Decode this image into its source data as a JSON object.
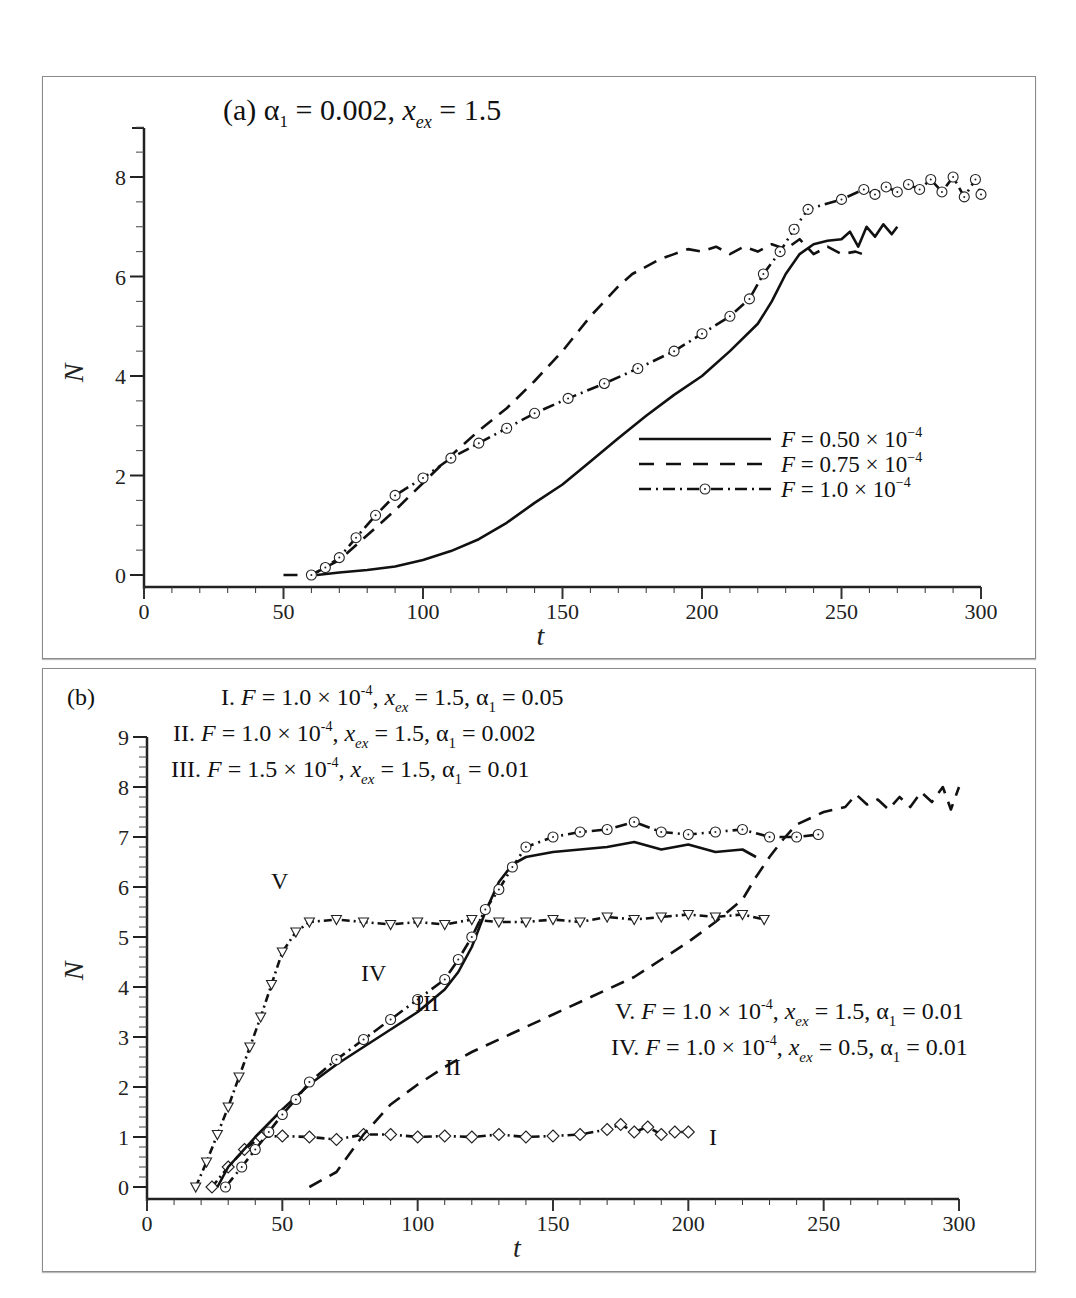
{
  "chart_data": [
    {
      "panel": "a",
      "type": "line",
      "title": "(a) α₁ = 0.002, x_ex = 1.5",
      "title_parts": {
        "label": "(a) ",
        "alpha": "α",
        "alpha_sub": "1",
        "eq1": " = 0.002, ",
        "x": "x",
        "x_sub": "ex",
        "eq2": " = 1.5"
      },
      "xlabel": "t",
      "ylabel": "N",
      "xlim": [
        0,
        300
      ],
      "ylim": [
        -0.25,
        9
      ],
      "xticks": [
        0,
        50,
        100,
        150,
        200,
        250,
        300
      ],
      "yticks": [
        0,
        2,
        4,
        6,
        8
      ],
      "grid": false,
      "legend_position": "lower right",
      "legend": [
        {
          "label_prefix": "F",
          "label_body": " = 0.50 × 10",
          "label_exp": "−4",
          "style": "solid"
        },
        {
          "label_prefix": "F",
          "label_body": " = 0.75 × 10",
          "label_exp": "−4",
          "style": "dashed"
        },
        {
          "label_prefix": "F",
          "label_body": " = 1.0 × 10",
          "label_exp": "−4",
          "style": "dashdot-circle"
        }
      ],
      "series": [
        {
          "name": "F = 0.50 × 10^-4",
          "style": "solid",
          "x": [
            62,
            70,
            80,
            90,
            100,
            110,
            120,
            130,
            140,
            150,
            160,
            170,
            180,
            190,
            200,
            210,
            220,
            225,
            230,
            235,
            240,
            245,
            250,
            253,
            256,
            259,
            262,
            265,
            268,
            270
          ],
          "y": [
            0,
            0.05,
            0.1,
            0.17,
            0.3,
            0.48,
            0.72,
            1.05,
            1.45,
            1.82,
            2.28,
            2.75,
            3.2,
            3.62,
            4.0,
            4.5,
            5.05,
            5.5,
            6.05,
            6.45,
            6.65,
            6.72,
            6.75,
            6.9,
            6.6,
            7.0,
            6.8,
            7.05,
            6.85,
            7.0
          ]
        },
        {
          "name": "F = 0.75 × 10^-4",
          "style": "dashed",
          "x": [
            50,
            60,
            70,
            80,
            90,
            100,
            110,
            120,
            130,
            140,
            150,
            160,
            170,
            175,
            180,
            185,
            190,
            195,
            200,
            205,
            210,
            215,
            220,
            225,
            230,
            235,
            240,
            245,
            250,
            255,
            260
          ],
          "y": [
            0,
            0,
            0.3,
            0.8,
            1.3,
            1.85,
            2.4,
            2.9,
            3.35,
            3.9,
            4.5,
            5.2,
            5.8,
            6.05,
            6.2,
            6.35,
            6.45,
            6.55,
            6.5,
            6.6,
            6.45,
            6.6,
            6.5,
            6.65,
            6.55,
            6.75,
            6.45,
            6.6,
            6.45,
            6.5,
            6.4
          ]
        },
        {
          "name": "F = 1.0 × 10^-4",
          "style": "dashdot-circle",
          "x": [
            60,
            65,
            70,
            76,
            83,
            90,
            100,
            110,
            120,
            130,
            140,
            152,
            165,
            177,
            190,
            200,
            210,
            217,
            222,
            228,
            233,
            238,
            250,
            258,
            262,
            266,
            270,
            274,
            278,
            282,
            286,
            290,
            294,
            298,
            300
          ],
          "y": [
            0,
            0.15,
            0.35,
            0.75,
            1.2,
            1.6,
            1.95,
            2.35,
            2.65,
            2.95,
            3.25,
            3.55,
            3.85,
            4.15,
            4.5,
            4.85,
            5.2,
            5.55,
            6.05,
            6.5,
            6.95,
            7.35,
            7.55,
            7.75,
            7.65,
            7.8,
            7.7,
            7.85,
            7.75,
            7.95,
            7.7,
            8.0,
            7.6,
            7.95,
            7.65
          ]
        }
      ]
    },
    {
      "panel": "b",
      "type": "line",
      "panel_label": "(b)",
      "xlabel": "t",
      "ylabel": "N",
      "xlim": [
        0,
        300
      ],
      "ylim": [
        -0.25,
        9
      ],
      "xticks": [
        0,
        50,
        100,
        150,
        200,
        250,
        300
      ],
      "yticks": [
        0,
        1,
        2,
        3,
        4,
        5,
        6,
        7,
        8,
        9
      ],
      "grid": false,
      "annotations": [
        {
          "roman": "I.",
          "F": "1.0",
          "x_ex": "1.5",
          "alpha1": "0.05"
        },
        {
          "roman": "II.",
          "F": "1.0",
          "x_ex": "1.5",
          "alpha1": "0.002"
        },
        {
          "roman": "III.",
          "F": "1.5",
          "x_ex": "1.5",
          "alpha1": "0.01"
        },
        {
          "roman": "V.",
          "F": "1.0",
          "x_ex": "1.5",
          "alpha1": "0.01"
        },
        {
          "roman": "IV.",
          "F": "1.0",
          "x_ex": "0.5",
          "alpha1": "0.01"
        }
      ],
      "curve_labels": {
        "I": "I",
        "II": "II",
        "III": "III",
        "IV": "IV",
        "V": "V"
      },
      "series": [
        {
          "name": "I",
          "style": "dashdot-diamond",
          "x": [
            24,
            30,
            36,
            42,
            50,
            60,
            70,
            80,
            90,
            100,
            110,
            120,
            130,
            140,
            150,
            160,
            170,
            175,
            180,
            185,
            190,
            195,
            200
          ],
          "y": [
            0,
            0.4,
            0.75,
            1.0,
            1.02,
            1.0,
            0.95,
            1.05,
            1.05,
            1.0,
            1.02,
            1.0,
            1.05,
            1.0,
            1.02,
            1.05,
            1.15,
            1.25,
            1.1,
            1.2,
            1.05,
            1.1,
            1.1
          ]
        },
        {
          "name": "II",
          "style": "dashed",
          "x": [
            60,
            70,
            80,
            90,
            100,
            110,
            120,
            130,
            140,
            150,
            160,
            170,
            180,
            190,
            200,
            210,
            220,
            225,
            230,
            235,
            240,
            250,
            258,
            262,
            266,
            270,
            274,
            278,
            282,
            286,
            290,
            294,
            297,
            300
          ],
          "y": [
            0,
            0.3,
            1.05,
            1.65,
            2.05,
            2.4,
            2.7,
            2.95,
            3.2,
            3.45,
            3.7,
            3.95,
            4.2,
            4.55,
            4.9,
            5.3,
            5.75,
            6.2,
            6.6,
            6.95,
            7.25,
            7.5,
            7.6,
            7.85,
            7.65,
            7.75,
            7.55,
            7.8,
            7.6,
            7.9,
            7.7,
            8.0,
            7.55,
            8.0
          ]
        },
        {
          "name": "III",
          "style": "solid",
          "x": [
            26,
            30,
            40,
            50,
            60,
            70,
            80,
            90,
            100,
            110,
            115,
            120,
            125,
            130,
            135,
            140,
            150,
            160,
            170,
            180,
            190,
            200,
            210,
            220,
            225
          ],
          "y": [
            0,
            0.4,
            1.0,
            1.55,
            2.05,
            2.45,
            2.8,
            3.15,
            3.5,
            3.95,
            4.3,
            4.8,
            5.5,
            6.1,
            6.45,
            6.6,
            6.7,
            6.75,
            6.8,
            6.9,
            6.75,
            6.85,
            6.7,
            6.75,
            6.6
          ]
        },
        {
          "name": "IV",
          "style": "dashdot-circle",
          "x": [
            29,
            35,
            40,
            45,
            50,
            55,
            60,
            70,
            80,
            90,
            100,
            110,
            115,
            120,
            125,
            130,
            135,
            140,
            150,
            160,
            170,
            180,
            190,
            200,
            210,
            220,
            230,
            240,
            248
          ],
          "y": [
            0,
            0.4,
            0.75,
            1.1,
            1.45,
            1.75,
            2.1,
            2.55,
            2.95,
            3.35,
            3.75,
            4.15,
            4.55,
            5.0,
            5.55,
            5.95,
            6.4,
            6.8,
            7.0,
            7.1,
            7.15,
            7.3,
            7.1,
            7.05,
            7.1,
            7.15,
            7.0,
            7.0,
            7.05
          ]
        },
        {
          "name": "V",
          "style": "dashdot-triangle",
          "x": [
            18,
            22,
            26,
            30,
            34,
            38,
            42,
            46,
            50,
            55,
            60,
            70,
            80,
            90,
            100,
            110,
            120,
            130,
            140,
            150,
            160,
            170,
            180,
            190,
            200,
            210,
            220,
            228
          ],
          "y": [
            0,
            0.5,
            1.05,
            1.6,
            2.2,
            2.8,
            3.4,
            4.05,
            4.7,
            5.1,
            5.3,
            5.35,
            5.3,
            5.25,
            5.3,
            5.25,
            5.35,
            5.3,
            5.3,
            5.35,
            5.3,
            5.4,
            5.35,
            5.4,
            5.45,
            5.4,
            5.45,
            5.35
          ]
        }
      ]
    }
  ]
}
